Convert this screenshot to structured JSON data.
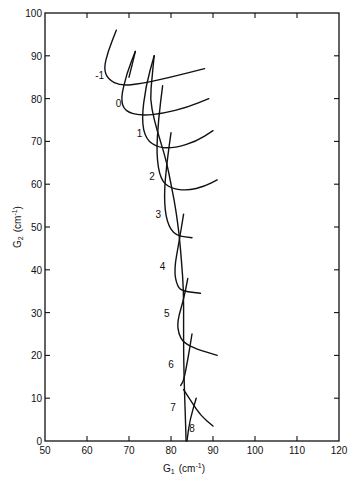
{
  "chart_data": {
    "type": "line",
    "title": "",
    "xlabel": "G1 (cm-1)",
    "ylabel": "G2 (cm-1)",
    "xlim": [
      50,
      120
    ],
    "ylim": [
      0,
      100
    ],
    "x_ticks": [
      50,
      60,
      70,
      80,
      90,
      100,
      110,
      120
    ],
    "y_ticks": [
      0,
      10,
      20,
      30,
      40,
      50,
      60,
      70,
      80,
      90,
      100
    ],
    "grid": false,
    "legend": "none",
    "curve_labels": [
      {
        "text": "-1",
        "x": 63,
        "y": 84.5
      },
      {
        "text": "0",
        "x": 67.5,
        "y": 78
      },
      {
        "text": "1",
        "x": 72.5,
        "y": 71
      },
      {
        "text": "2",
        "x": 75.5,
        "y": 61
      },
      {
        "text": "3",
        "x": 77,
        "y": 52
      },
      {
        "text": "4",
        "x": 78,
        "y": 40
      },
      {
        "text": "5",
        "x": 79,
        "y": 29
      },
      {
        "text": "6",
        "x": 80,
        "y": 17
      },
      {
        "text": "7",
        "x": 80.5,
        "y": 7
      },
      {
        "text": "8",
        "x": 85,
        "y": 2
      }
    ],
    "series": [
      {
        "name": "-1",
        "points": [
          [
            67,
            96
          ],
          [
            65,
            91
          ],
          [
            64,
            87
          ],
          [
            65,
            84.5
          ],
          [
            68,
            83
          ],
          [
            73,
            83.5
          ],
          [
            80,
            85
          ],
          [
            88,
            87
          ]
        ]
      },
      {
        "name": "0",
        "points": [
          [
            71.5,
            91
          ],
          [
            69.5,
            86
          ],
          [
            68,
            80
          ],
          [
            69,
            77
          ],
          [
            73,
            76
          ],
          [
            78,
            76.5
          ],
          [
            84,
            78
          ],
          [
            89,
            80
          ]
        ]
      },
      {
        "name": "1",
        "points": [
          [
            76,
            90
          ],
          [
            74,
            83
          ],
          [
            73,
            75
          ],
          [
            74,
            70.5
          ],
          [
            77,
            68.5
          ],
          [
            81,
            68.5
          ],
          [
            86,
            70
          ],
          [
            90,
            72.5
          ]
        ]
      },
      {
        "name": "2",
        "points": [
          [
            78,
            83
          ],
          [
            77,
            75
          ],
          [
            76.5,
            67
          ],
          [
            77.5,
            61
          ],
          [
            80,
            59
          ],
          [
            84,
            58.5
          ],
          [
            88,
            59.5
          ],
          [
            91,
            61
          ]
        ]
      },
      {
        "name": "3",
        "points": [
          [
            80,
            72
          ],
          [
            79,
            65
          ],
          [
            78.3,
            57
          ],
          [
            79,
            51
          ],
          [
            81,
            48
          ],
          [
            85,
            47.5
          ]
        ]
      },
      {
        "name": "4",
        "points": [
          [
            83,
            53
          ],
          [
            82,
            47
          ],
          [
            80.7,
            40
          ],
          [
            81.5,
            36
          ],
          [
            83,
            35
          ],
          [
            87,
            34.5
          ]
        ]
      },
      {
        "name": "5",
        "points": [
          [
            84,
            38
          ],
          [
            83,
            33
          ],
          [
            81.5,
            28
          ],
          [
            81.8,
            25
          ],
          [
            83,
            23
          ],
          [
            86,
            21.5
          ],
          [
            91,
            20
          ]
        ]
      },
      {
        "name": "6",
        "points": [
          [
            85,
            25
          ],
          [
            84,
            19
          ],
          [
            83,
            14
          ],
          [
            82.3,
            13
          ]
        ]
      },
      {
        "name": "6-right",
        "points": [
          [
            83,
            12
          ],
          [
            85,
            9
          ],
          [
            87,
            6
          ],
          [
            90,
            3.5
          ]
        ]
      },
      {
        "name": "7",
        "points": [
          [
            86,
            10
          ],
          [
            84.5,
            5
          ],
          [
            83.8,
            0
          ]
        ]
      },
      {
        "name": "cross-line-a",
        "points": [
          [
            71.5,
            91
          ],
          [
            70,
            85
          ]
        ]
      },
      {
        "name": "main-stem",
        "points": [
          [
            76,
            90
          ],
          [
            75.5,
            85
          ],
          [
            75,
            80
          ],
          [
            76,
            75
          ],
          [
            77.5,
            70
          ],
          [
            79,
            65
          ],
          [
            80,
            60
          ],
          [
            81,
            55
          ],
          [
            82,
            48
          ],
          [
            82.5,
            42
          ],
          [
            83,
            35
          ],
          [
            83,
            28
          ],
          [
            83,
            20
          ],
          [
            83.2,
            12
          ],
          [
            83.6,
            0
          ]
        ]
      }
    ]
  },
  "axes": {
    "x_title": "G",
    "x_sub": "1",
    "x_unit": "(cm",
    "x_unit_sup": "-1",
    "x_unit_close": ")",
    "y_title": "G",
    "y_sub": "2",
    "y_unit": "(cm",
    "y_unit_sup": "-1",
    "y_unit_close": ")"
  }
}
